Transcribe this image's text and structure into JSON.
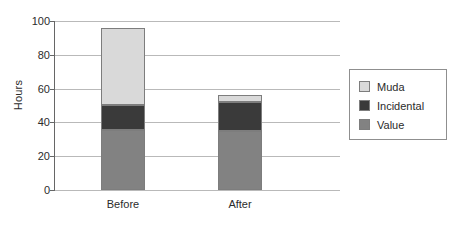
{
  "chart_data": {
    "type": "bar",
    "subtype": "stacked-bar",
    "title": "",
    "xlabel": "",
    "ylabel": "Hours",
    "ylim": [
      0,
      100
    ],
    "yticks": [
      0,
      20,
      40,
      60,
      80,
      100
    ],
    "ytick_labels": [
      "0",
      "20",
      "40",
      "60",
      "80",
      "100"
    ],
    "categories": [
      "Before",
      "After"
    ],
    "grid": true,
    "legend_position": "right",
    "series": [
      {
        "name": "Value",
        "color": "#828282",
        "values": [
          35.5,
          35
        ]
      },
      {
        "name": "Incidental",
        "color": "#3a3a3a",
        "values": [
          15,
          17
        ]
      },
      {
        "name": "Muda",
        "color": "#d9d9d9",
        "values": [
          45.5,
          4
        ]
      }
    ],
    "totals": [
      96,
      56
    ],
    "legend_order": [
      "Muda",
      "Incidental",
      "Value"
    ]
  },
  "axis": {
    "y_title": "Hours"
  },
  "legend": {
    "entries": [
      {
        "label": "Muda",
        "color": "#d9d9d9"
      },
      {
        "label": "Incidental",
        "color": "#3a3a3a"
      },
      {
        "label": "Value",
        "color": "#828282"
      }
    ]
  }
}
